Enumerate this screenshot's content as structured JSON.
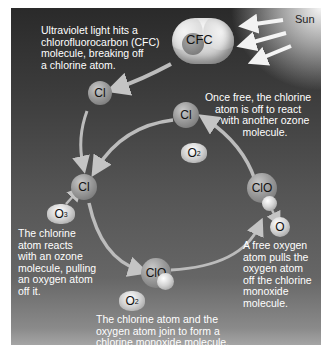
{
  "diagram": {
    "sun_label": "Sun",
    "cfc_label": "CFC",
    "atoms": {
      "cl_top_left": "Cl",
      "cl_top_right": "Cl",
      "cl_left": "Cl",
      "clo_bottom": "ClO",
      "clo_right": "ClO",
      "o_free": "O",
      "o3": {
        "symbol": "O",
        "subscript": "3"
      },
      "o2_top": {
        "symbol": "O",
        "subscript": "2"
      },
      "o2_bottom": {
        "symbol": "O",
        "subscript": "2"
      }
    },
    "captions": {
      "step1": "Ultraviolet light hits a chlorofluorocarbon (CFC) molecule, breaking off a chlorine atom.",
      "step1_lines": [
        "Ultraviolet light hits a",
        "chlorofluorocarbon (CFC)",
        "molecule, breaking off",
        "a chlorine atom."
      ],
      "step2_lines": [
        "The chlorine",
        "atom reacts",
        "with an ozone",
        "molecule, pulling",
        "an oxygen atom",
        "off it."
      ],
      "step3_lines": [
        "The chlorine atom and the",
        "oxygen atom join to form a",
        "chlorine monoxide molecule."
      ],
      "step4_lines": [
        "A free oxygen",
        "atom pulls the",
        "oxygen atom",
        "off the chlorine",
        "monoxide",
        "molecule."
      ],
      "step5_lines": [
        "Once free, the chlorine",
        "atom is off to react",
        "with another ozone",
        "molecule."
      ]
    },
    "colors": {
      "panel_dark": "#2a2a2a",
      "panel_light": "#a5a5a5",
      "arrow": "#b8b8b8",
      "text": "#ffffff"
    }
  }
}
